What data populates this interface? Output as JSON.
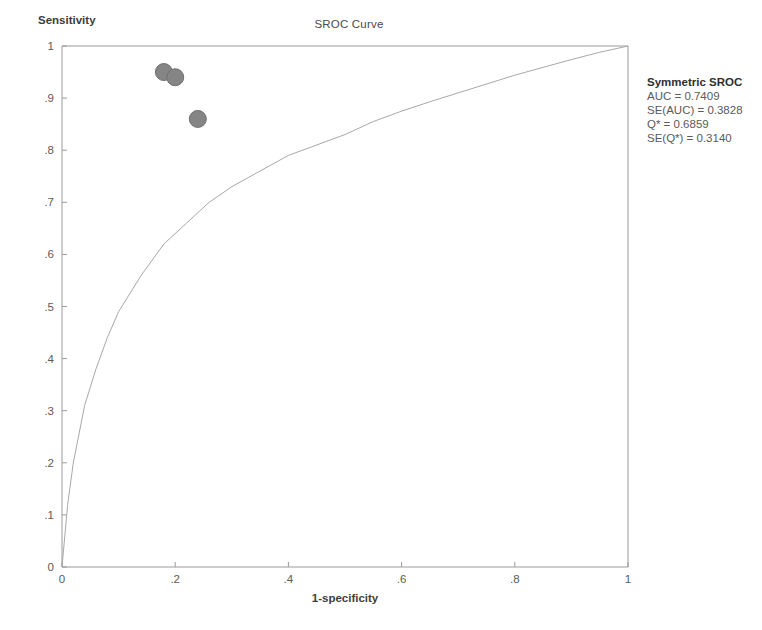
{
  "chart_data": {
    "type": "scatter",
    "title": "SROC Curve",
    "xlabel": "1-specificity",
    "ylabel": "Sensitivity",
    "xlim": [
      0,
      1
    ],
    "ylim": [
      0,
      1
    ],
    "grid": false,
    "x_ticks": [
      "0",
      ".2",
      ".4",
      ".6",
      ".8",
      "1"
    ],
    "x_tick_values": [
      0,
      0.2,
      0.4,
      0.6,
      0.8,
      1
    ],
    "y_ticks": [
      "0",
      ".1",
      ".2",
      ".3",
      ".4",
      ".5",
      ".6",
      ".7",
      ".8",
      ".9",
      "1"
    ],
    "y_tick_values": [
      0,
      0.1,
      0.2,
      0.3,
      0.4,
      0.5,
      0.6,
      0.7,
      0.8,
      0.9,
      1
    ],
    "series": [
      {
        "name": "Study estimates",
        "type": "scatter",
        "marker": "filled-circle",
        "color": "#858585",
        "points": [
          {
            "x": 0.18,
            "y": 0.95
          },
          {
            "x": 0.2,
            "y": 0.94
          },
          {
            "x": 0.24,
            "y": 0.86
          }
        ]
      },
      {
        "name": "Symmetric SROC curve",
        "type": "line",
        "color": "#a8a8a8",
        "points": [
          {
            "x": 0.0,
            "y": 0.0
          },
          {
            "x": 0.01,
            "y": 0.12
          },
          {
            "x": 0.02,
            "y": 0.2
          },
          {
            "x": 0.04,
            "y": 0.31
          },
          {
            "x": 0.06,
            "y": 0.38
          },
          {
            "x": 0.08,
            "y": 0.44
          },
          {
            "x": 0.1,
            "y": 0.49
          },
          {
            "x": 0.14,
            "y": 0.56
          },
          {
            "x": 0.18,
            "y": 0.62
          },
          {
            "x": 0.22,
            "y": 0.66
          },
          {
            "x": 0.26,
            "y": 0.7
          },
          {
            "x": 0.3,
            "y": 0.73
          },
          {
            "x": 0.35,
            "y": 0.76
          },
          {
            "x": 0.4,
            "y": 0.79
          },
          {
            "x": 0.45,
            "y": 0.81
          },
          {
            "x": 0.5,
            "y": 0.83
          },
          {
            "x": 0.55,
            "y": 0.855
          },
          {
            "x": 0.6,
            "y": 0.875
          },
          {
            "x": 0.65,
            "y": 0.893
          },
          {
            "x": 0.7,
            "y": 0.91
          },
          {
            "x": 0.75,
            "y": 0.927
          },
          {
            "x": 0.8,
            "y": 0.944
          },
          {
            "x": 0.85,
            "y": 0.959
          },
          {
            "x": 0.9,
            "y": 0.974
          },
          {
            "x": 0.95,
            "y": 0.988
          },
          {
            "x": 1.0,
            "y": 1.0
          }
        ]
      }
    ],
    "annotations": {
      "legend_title": "Symmetric SROC",
      "lines": [
        "AUC = 0.7409",
        "SE(AUC) = 0.3828",
        "Q* = 0.6859",
        "SE(Q*) = 0.3140"
      ],
      "auc": 0.7409,
      "se_auc": 0.3828,
      "q_star": 0.6859,
      "se_q_star": 0.314
    },
    "colors": {
      "marker": "#858585",
      "curve": "#a8a8a8",
      "axis": "#9a9a9a",
      "text": "#555555"
    }
  }
}
